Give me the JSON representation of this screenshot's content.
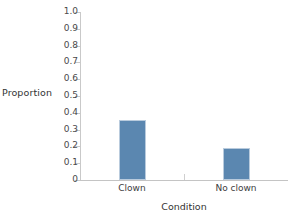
{
  "chart_data": {
    "type": "bar",
    "title": "",
    "subtitle": "",
    "xlabel": "Condition",
    "ylabel": "Proportion",
    "categories": [
      "Clown",
      "No clown"
    ],
    "values": [
      0.36,
      0.19
    ],
    "series": [
      {
        "name": "Proportion",
        "values": [
          0.36,
          0.19
        ]
      }
    ],
    "ylim": [
      0,
      1.0
    ],
    "ytick_labels": [
      "0",
      "0.1",
      "0.2",
      "0.3",
      "0.4",
      "0.5",
      "0.6",
      "0.7",
      "0.8",
      "0.9",
      "1.0"
    ],
    "ytick_values": [
      0,
      0.1,
      0.2,
      0.3,
      0.4,
      0.5,
      0.6,
      0.7,
      0.8,
      0.9,
      1.0
    ],
    "grid": false,
    "legend": false,
    "legend_position": "none",
    "annotations": [],
    "colors": {
      "bar_fill": "#5b87b0",
      "bar_border": "#b9cbdd",
      "axis": "#c9c9c9",
      "text": "#3d3d3d",
      "background": "#ffffff"
    }
  }
}
